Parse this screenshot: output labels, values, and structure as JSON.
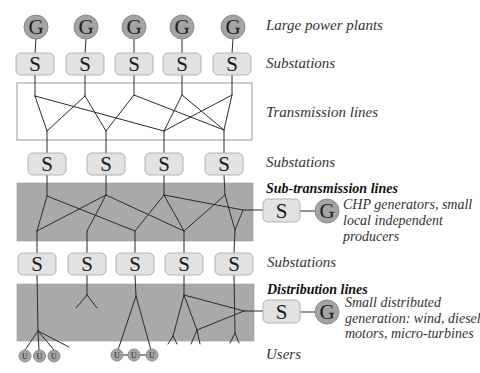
{
  "diagram": {
    "node_letters": {
      "generator": "G",
      "substation": "S",
      "user": "U"
    },
    "levels": {
      "large_power_plants": "Large power plants",
      "substations_1": "Substations",
      "transmission_lines": "Transmission lines",
      "substations_2": "Substations",
      "sub_transmission_lines": "Sub-transmission lines",
      "substations_3": "Substations",
      "distribution_lines": "Distribution lines",
      "users": "Users"
    },
    "side_sources": {
      "sub_transmission": [
        "CHP generators, small",
        "local independent",
        "producers"
      ],
      "distribution": [
        "Small distributed",
        "generation: wind, diesel",
        "motors, micro-turbines"
      ]
    },
    "counts": {
      "large_power_plants": 5,
      "substations_row1": 5,
      "substations_row2": 4,
      "substations_row3": 5,
      "users": 6
    }
  },
  "colors": {
    "gen-fill": "#a4a4a4",
    "sub-fill": "#e2e2e2",
    "band-fill": "#a9a9a9",
    "line": "#2b2b2b",
    "text": "#333333"
  }
}
